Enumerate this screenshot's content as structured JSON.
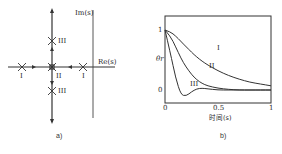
{
  "panel_a": {
    "caption": "a)",
    "axis_labels": {
      "imag": "Im(s)",
      "real": "Re(s)"
    },
    "pole_labels": {
      "left_I": "I",
      "right_I": "I",
      "origin_II": "II",
      "upper_III": "III",
      "lower_III": "III"
    }
  },
  "panel_b": {
    "caption": "b)",
    "xlabel": "时间(s)",
    "ylabel": "θr",
    "xticks": [
      "0",
      "0.5",
      "1"
    ],
    "yticks": [
      "1",
      "0"
    ],
    "curve_labels": {
      "I": "I",
      "II": "II",
      "III": "III"
    }
  },
  "chart_data": [
    {
      "type": "scatter",
      "title": "Root locus (s-plane)",
      "xlabel": "Re(s)",
      "ylabel": "Im(s)",
      "grid": false,
      "points": [
        {
          "label": "I",
          "re": -1.0,
          "im": 0.0
        },
        {
          "label": "I",
          "re": 2.1,
          "im": 0.0
        },
        {
          "label": "II",
          "re": 0.0,
          "im": 0.0
        },
        {
          "label": "III",
          "re": 0.0,
          "im": 1.0
        },
        {
          "label": "III",
          "re": 0.0,
          "im": -1.0
        }
      ],
      "annotations": [
        "arrows along real axis toward origin",
        "arrows along imaginary axis away from origin",
        "vertical boundary line labeled Im(s)"
      ]
    },
    {
      "type": "line",
      "title": "",
      "xlabel": "时间(s)",
      "ylabel": "θr",
      "xlim": [
        0,
        1
      ],
      "ylim": [
        -0.15,
        1.15
      ],
      "grid": false,
      "x": [
        0,
        0.05,
        0.1,
        0.15,
        0.2,
        0.25,
        0.3,
        0.35,
        0.4,
        0.5,
        0.6,
        0.7,
        0.8,
        0.9,
        1.0
      ],
      "series": [
        {
          "name": "I",
          "values": [
            1.0,
            0.97,
            0.9,
            0.81,
            0.72,
            0.63,
            0.55,
            0.48,
            0.42,
            0.32,
            0.24,
            0.18,
            0.13,
            0.1,
            0.07
          ]
        },
        {
          "name": "II",
          "values": [
            1.0,
            0.9,
            0.72,
            0.53,
            0.38,
            0.26,
            0.17,
            0.11,
            0.07,
            0.03,
            0.01,
            0.0,
            0.0,
            0.0,
            0.0
          ]
        },
        {
          "name": "III",
          "values": [
            1.0,
            0.62,
            0.2,
            -0.08,
            -0.1,
            -0.03,
            0.02,
            0.03,
            0.02,
            0.0,
            0.0,
            0.0,
            0.0,
            0.0,
            0.0
          ]
        }
      ]
    }
  ]
}
